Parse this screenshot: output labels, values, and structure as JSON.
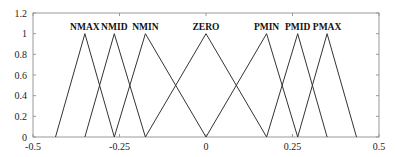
{
  "chart_data": {
    "type": "line",
    "title": "",
    "xlabel": "",
    "ylabel": "",
    "xlim": [
      -0.5,
      0.5
    ],
    "ylim": [
      0,
      1.2
    ],
    "grid": false,
    "legend": "none (labels placed above peaks)",
    "x_ticks": [
      -0.5,
      -0.25,
      0,
      0.25,
      0.5
    ],
    "x_tick_labels": [
      "-0.5",
      "-0.25",
      "0",
      "0.25",
      "0.5"
    ],
    "y_ticks": [
      0,
      0.2,
      0.4,
      0.6,
      0.8,
      1,
      1.2
    ],
    "y_tick_labels": [
      "0",
      "0.2",
      "0.4",
      "0.6",
      "0.8",
      "1",
      "1.2"
    ],
    "series": [
      {
        "name": "NMAX",
        "x": [
          -0.435,
          -0.35,
          -0.265
        ],
        "y": [
          0,
          1,
          0
        ]
      },
      {
        "name": "NMID",
        "x": [
          -0.35,
          -0.265,
          -0.175
        ],
        "y": [
          0,
          1,
          0
        ]
      },
      {
        "name": "NMIN",
        "x": [
          -0.265,
          -0.175,
          0
        ],
        "y": [
          0,
          1,
          0
        ]
      },
      {
        "name": "ZERO",
        "x": [
          -0.175,
          0,
          0.175
        ],
        "y": [
          0,
          1,
          0
        ]
      },
      {
        "name": "PMIN",
        "x": [
          0,
          0.175,
          0.265
        ],
        "y": [
          0,
          1,
          0
        ]
      },
      {
        "name": "PMID",
        "x": [
          0.175,
          0.265,
          0.35
        ],
        "y": [
          0,
          1,
          0
        ]
      },
      {
        "name": "PMAX",
        "x": [
          0.265,
          0.35,
          0.435
        ],
        "y": [
          0,
          1,
          0
        ]
      }
    ]
  },
  "layout": {
    "plot_left": 33,
    "plot_right": 379,
    "plot_top": 13,
    "plot_bottom": 137,
    "line_color": "#333333",
    "frame_color": "#999999"
  }
}
